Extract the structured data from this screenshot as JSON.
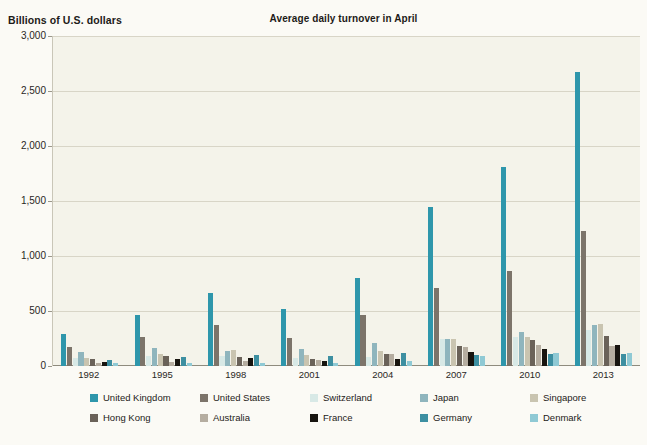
{
  "chart_data": {
    "type": "bar",
    "title": "Average daily turnover in April",
    "ylabel": "Billions of U.S. dollars",
    "xlabel": "",
    "ylim": [
      0,
      3000
    ],
    "yticks": [
      "0",
      "500",
      "1,000",
      "1,500",
      "2,000",
      "2,500",
      "3,000"
    ],
    "ytick_values": [
      0,
      500,
      1000,
      1500,
      2000,
      2500,
      3000
    ],
    "grid": true,
    "legend_position": "bottom",
    "categories": [
      "1992",
      "1995",
      "1998",
      "2001",
      "2004",
      "2007",
      "2010",
      "2013"
    ],
    "series": [
      {
        "name": "United Kingdom",
        "color": "#2e96ab",
        "values": [
          291,
          464,
          665,
          521,
          800,
          1450,
          1810,
          2670
        ]
      },
      {
        "name": "United States",
        "color": "#7c746a",
        "values": [
          172,
          263,
          370,
          255,
          466,
          705,
          860,
          1230
        ]
      },
      {
        "name": "Switzerland",
        "color": "#d8e9e6",
        "values": [
          71,
          91,
          95,
          76,
          85,
          250,
          260,
          330
        ]
      },
      {
        "name": "Japan",
        "color": "#8fb5bd",
        "values": [
          123,
          167,
          140,
          153,
          207,
          250,
          312,
          375
        ]
      },
      {
        "name": "Singapore",
        "color": "#c9c4b0",
        "values": [
          76,
          107,
          145,
          104,
          134,
          242,
          266,
          383
        ]
      },
      {
        "name": "Hong Kong",
        "color": "#6a6259",
        "values": [
          61,
          91,
          80,
          68,
          106,
          181,
          238,
          275
        ]
      },
      {
        "name": "Australia",
        "color": "#b5ada0",
        "values": [
          30,
          41,
          48,
          54,
          107,
          176,
          192,
          182
        ]
      },
      {
        "name": "France",
        "color": "#17140f",
        "values": [
          35,
          62,
          77,
          50,
          67,
          127,
          152,
          190
        ]
      },
      {
        "name": "Germany",
        "color": "#3d8fa1",
        "values": [
          57,
          79,
          100,
          91,
          120,
          101,
          109,
          111
        ]
      },
      {
        "name": "Denmark",
        "color": "#8fc9d4",
        "values": [
          27,
          31,
          28,
          24,
          42,
          88,
          120,
          117
        ]
      }
    ]
  }
}
